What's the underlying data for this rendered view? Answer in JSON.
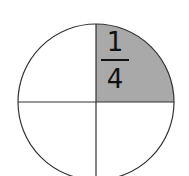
{
  "diagram": {
    "type": "fraction-circle",
    "shape": "circle",
    "parts": 4,
    "shaded_parts": 1,
    "shaded_quadrant": "top-right",
    "fraction": {
      "numerator": "1",
      "denominator": "4"
    },
    "colors": {
      "shade": "#a9a9a9",
      "stroke": "#333333",
      "background": "#ffffff"
    }
  }
}
